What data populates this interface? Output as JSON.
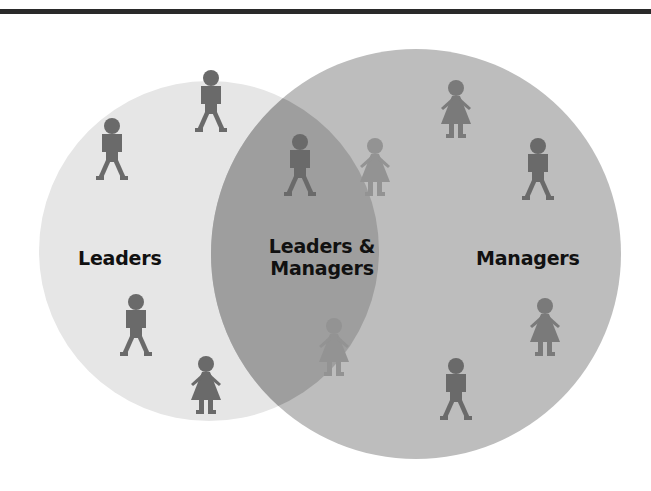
{
  "diagram": {
    "type": "venn",
    "sets": [
      {
        "id": "leaders",
        "label": "Leaders",
        "fill": "#e6e6e6"
      },
      {
        "id": "managers",
        "label": "Managers",
        "fill": "#bdbdbd"
      }
    ],
    "intersection": {
      "label_line1": "Leaders &",
      "label_line2": "Managers",
      "fill": "#9e9e9e"
    },
    "figure_color": "#6a6a6a",
    "figures": {
      "leaders_only": [
        "man",
        "man",
        "man",
        "woman"
      ],
      "both": [
        "man",
        "woman",
        "woman"
      ],
      "managers_only": [
        "woman",
        "man",
        "woman",
        "man"
      ]
    }
  }
}
